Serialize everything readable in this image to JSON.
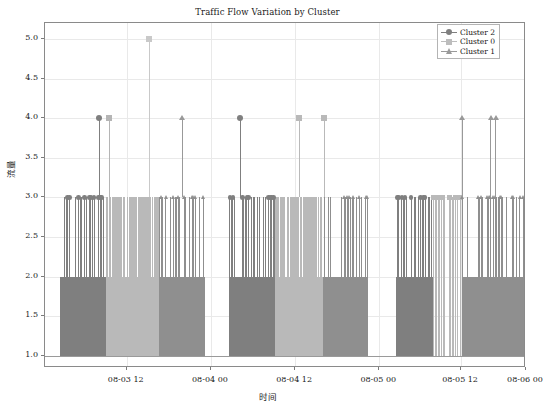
{
  "chart_data": {
    "type": "bar",
    "title": "Traffic Flow Variation by Cluster",
    "xlabel": "时间",
    "ylabel": "流量",
    "ylim": [
      0.85,
      5.2
    ],
    "yticks": [
      1.0,
      1.5,
      2.0,
      2.5,
      3.0,
      3.5,
      4.0,
      4.5,
      5.0
    ],
    "ytick_labels": [
      "1.0",
      "1.5",
      "2.0",
      "2.5",
      "3.0",
      "3.5",
      "4.0",
      "4.5",
      "5.0"
    ],
    "xtick_labels": [
      "08-03 12",
      "08-04 00",
      "08-04 12",
      "08-05 00",
      "08-05 12",
      "08-06 00"
    ],
    "xtick_positions": [
      0.17,
      0.345,
      0.52,
      0.695,
      0.865,
      1.0
    ],
    "grid": true,
    "legend_position": "upper right",
    "baseline": 1.0,
    "series": [
      {
        "name": "Cluster 2",
        "marker": "circle",
        "color": "#7f7f7f",
        "values": [
          3,
          3,
          3,
          2,
          3,
          3,
          2,
          4,
          3,
          2,
          3,
          3,
          2,
          3,
          2,
          3,
          3,
          2,
          3,
          3,
          2,
          2,
          3,
          3
        ]
      },
      {
        "name": "Cluster 0",
        "marker": "square",
        "color": "#b5b5b5",
        "values": [
          3,
          3,
          5,
          3,
          3,
          3,
          4,
          3,
          3,
          4,
          3,
          3,
          2,
          3,
          3,
          3,
          3,
          2,
          3,
          3,
          3,
          3,
          2,
          3
        ]
      },
      {
        "name": "Cluster 1",
        "marker": "triangle",
        "color": "#999999",
        "values": [
          3,
          3,
          3,
          4,
          3,
          2,
          3,
          3,
          4,
          3,
          3,
          2,
          3,
          3,
          3,
          4,
          3,
          3,
          2,
          3,
          4,
          4,
          3,
          3
        ]
      }
    ],
    "blocks": [
      {
        "label": "block-1",
        "bands": [
          {
            "cluster": "Cluster 2",
            "x0": 0.032,
            "x1": 0.126,
            "plateau": 2.0,
            "color": "#7f7f7f"
          },
          {
            "cluster": "Cluster 0",
            "x0": 0.126,
            "x1": 0.236,
            "plateau": 3.0,
            "color": "#b9b9b9"
          },
          {
            "cluster": "Cluster 1",
            "x0": 0.236,
            "x1": 0.332,
            "plateau": 2.0,
            "color": "#8f8f8f"
          }
        ]
      },
      {
        "label": "block-2",
        "bands": [
          {
            "cluster": "Cluster 2",
            "x0": 0.382,
            "x1": 0.478,
            "plateau": 2.0,
            "color": "#7f7f7f"
          },
          {
            "cluster": "Cluster 0",
            "x0": 0.478,
            "x1": 0.578,
            "plateau": 3.0,
            "color": "#b9b9b9"
          },
          {
            "cluster": "Cluster 1",
            "x0": 0.578,
            "x1": 0.672,
            "plateau": 2.0,
            "color": "#8f8f8f"
          }
        ]
      },
      {
        "label": "block-3",
        "bands": [
          {
            "cluster": "Cluster 2",
            "x0": 0.73,
            "x1": 0.806,
            "plateau": 2.0,
            "color": "#7f7f7f"
          },
          {
            "cluster": "Cluster 0",
            "x0": 0.806,
            "x1": 0.866,
            "plateau": 1.0,
            "color": "#b9b9b9"
          },
          {
            "cluster": "Cluster 1",
            "x0": 0.866,
            "x1": 0.995,
            "plateau": 2.0,
            "color": "#8f8f8f"
          }
        ]
      }
    ],
    "peak_markers": [
      {
        "x": 0.112,
        "y": 4.0,
        "marker": "circle",
        "color": "#7f7f7f",
        "cluster": "Cluster 2"
      },
      {
        "x": 0.133,
        "y": 4.0,
        "marker": "square",
        "color": "#b5b5b5",
        "cluster": "Cluster 0"
      },
      {
        "x": 0.216,
        "y": 5.0,
        "marker": "square",
        "color": "#c9c9c9",
        "cluster": "Cluster 0"
      },
      {
        "x": 0.284,
        "y": 4.0,
        "marker": "triangle",
        "color": "#999999",
        "cluster": "Cluster 1"
      },
      {
        "x": 0.405,
        "y": 4.0,
        "marker": "circle",
        "color": "#7f7f7f",
        "cluster": "Cluster 2"
      },
      {
        "x": 0.528,
        "y": 4.0,
        "marker": "square",
        "color": "#b9b9b9",
        "cluster": "Cluster 0"
      },
      {
        "x": 0.58,
        "y": 4.0,
        "marker": "square",
        "color": "#b9b9b9",
        "cluster": "Cluster 0"
      },
      {
        "x": 0.866,
        "y": 4.0,
        "marker": "triangle",
        "color": "#999999",
        "cluster": "Cluster 1"
      },
      {
        "x": 0.926,
        "y": 4.0,
        "marker": "triangle",
        "color": "#999999",
        "cluster": "Cluster 1"
      },
      {
        "x": 0.936,
        "y": 4.0,
        "marker": "triangle",
        "color": "#999999",
        "cluster": "Cluster 1"
      }
    ]
  },
  "legend": {
    "items": [
      {
        "label": "Cluster 2",
        "marker": "circle",
        "color": "#7f7f7f"
      },
      {
        "label": "Cluster 0",
        "marker": "square",
        "color": "#bdbdbd"
      },
      {
        "label": "Cluster 1",
        "marker": "triangle",
        "color": "#9a9a9a"
      }
    ]
  }
}
